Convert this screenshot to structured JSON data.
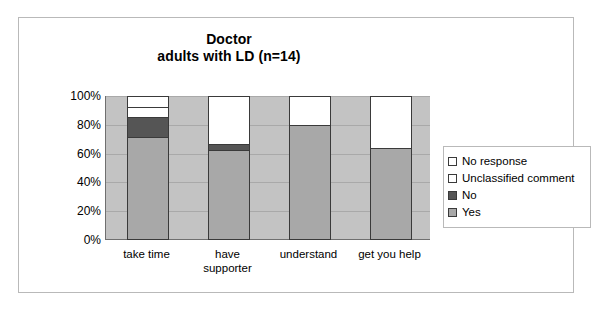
{
  "chart_data": {
    "type": "bar",
    "subtype": "stacked-percent",
    "title": "Doctor",
    "subtitle": "adults with LD (n=14)",
    "xlabel": "",
    "ylabel": "",
    "ylim": [
      0,
      100
    ],
    "grid": true,
    "legend_position": "right",
    "categories": [
      "take time",
      "have supporter",
      "understand",
      "get you help"
    ],
    "category_lines": [
      [
        "take time"
      ],
      [
        "have",
        "supporter"
      ],
      [
        "understand"
      ],
      [
        "get you help"
      ]
    ],
    "ytick_labels": [
      "100%",
      "80%",
      "60%",
      "40%",
      "20%",
      "0%"
    ],
    "ytick_values": [
      100,
      80,
      60,
      40,
      20,
      0
    ],
    "series": [
      {
        "name": "Yes",
        "color": "#a8a8a8",
        "values": [
          72,
          63,
          80,
          64
        ]
      },
      {
        "name": "No",
        "color": "#555555",
        "values": [
          14,
          4,
          0,
          0
        ]
      },
      {
        "name": "Unclassified comment",
        "color": "#ffffff",
        "values": [
          7,
          33,
          20,
          36
        ]
      },
      {
        "name": "No response",
        "color": "#ffffff",
        "values": [
          7,
          0,
          0,
          0
        ]
      }
    ],
    "legend_order": [
      "No response",
      "Unclassified comment",
      "No",
      "Yes"
    ],
    "plot_background": "#c3c3c3",
    "frame_color": "#b9b9b9",
    "bar_outline": "#3a3a3a"
  },
  "legend": {
    "items": [
      {
        "label": "No response",
        "color": "#ffffff"
      },
      {
        "label": "Unclassified comment",
        "color": "#ffffff"
      },
      {
        "label": "No",
        "color": "#555555"
      },
      {
        "label": "Yes",
        "color": "#a8a8a8"
      }
    ]
  }
}
